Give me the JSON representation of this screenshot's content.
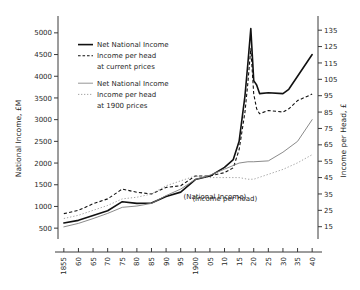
{
  "chart_data": {
    "type": "line",
    "title": "",
    "xlabel": "",
    "ylabel": "National Income, £M",
    "y2label": "Income per Head, £",
    "grid": false,
    "legend_position": "upper-left-inside",
    "x": [
      1855,
      1860,
      1865,
      1870,
      1875,
      1880,
      1885,
      1890,
      1895,
      1900,
      1905,
      1910,
      1915,
      1920,
      1925,
      1930,
      1935,
      1940
    ],
    "xlim": [
      1853,
      1942
    ],
    "xtick_labels": [
      "1855",
      "60",
      "65",
      "70",
      "75",
      "80",
      "85",
      "90",
      "95",
      "1900",
      "05",
      "10",
      "15",
      "20",
      "25",
      "30",
      "35",
      "40"
    ],
    "ylim": [
      250,
      5250
    ],
    "ytick_labels": [
      "500",
      "1000",
      "1500",
      "2000",
      "2500",
      "3000",
      "3500",
      "4000",
      "4500",
      "5000"
    ],
    "yticks": [
      500,
      1000,
      1500,
      2000,
      2500,
      3000,
      3500,
      4000,
      4500,
      5000
    ],
    "y2lim": [
      7.5,
      140
    ],
    "y2tick_labels": [
      "15",
      "25",
      "35",
      "45",
      "55",
      "65",
      "75",
      "85",
      "95",
      "105",
      "115",
      "125",
      "135"
    ],
    "y2ticks": [
      15,
      25,
      35,
      45,
      55,
      65,
      75,
      85,
      95,
      105,
      115,
      125,
      135
    ],
    "annotations": [
      {
        "text": "(National Income)",
        "x": 1896,
        "y_axis": "left",
        "y": 1180
      },
      {
        "text": "(Income per head)",
        "x": 1899,
        "y_axis": "right",
        "y": 31
      }
    ],
    "series": [
      {
        "name": "Net National Income at current prices",
        "axis": "left",
        "style": "solid-bold",
        "color": "#111111",
        "x": [
          1855,
          1860,
          1865,
          1870,
          1875,
          1880,
          1885,
          1890,
          1895,
          1900,
          1905,
          1910,
          1913,
          1915,
          1917,
          1918,
          1919,
          1920,
          1921,
          1922,
          1925,
          1930,
          1932,
          1935,
          1940
        ],
        "values": [
          620,
          680,
          790,
          900,
          1110,
          1070,
          1080,
          1230,
          1330,
          1620,
          1700,
          1900,
          2080,
          2500,
          3550,
          4300,
          5100,
          3900,
          3800,
          3600,
          3620,
          3600,
          3700,
          4000,
          4500
        ]
      },
      {
        "name": "Income per head at current prices",
        "axis": "right",
        "style": "dash-bold",
        "color": "#111111",
        "x": [
          1855,
          1860,
          1865,
          1870,
          1875,
          1880,
          1885,
          1890,
          1895,
          1900,
          1905,
          1910,
          1913,
          1915,
          1917,
          1918,
          1919,
          1920,
          1921,
          1922,
          1925,
          1930,
          1932,
          1935,
          1940
        ],
        "values": [
          23,
          25,
          29,
          32,
          38,
          36,
          35,
          39,
          40,
          46,
          46,
          48,
          51,
          62,
          85,
          103,
          124,
          96,
          87,
          84,
          86,
          85,
          87,
          92,
          96
        ]
      },
      {
        "name": "Net National Income at 1900 prices",
        "axis": "left",
        "style": "solid-thin",
        "color": "#7d7d7d",
        "x": [
          1855,
          1860,
          1865,
          1870,
          1875,
          1880,
          1885,
          1890,
          1895,
          1900,
          1905,
          1910,
          1915,
          1918,
          1920,
          1925,
          1930,
          1935,
          1940
        ],
        "values": [
          530,
          610,
          720,
          840,
          980,
          1010,
          1070,
          1250,
          1400,
          1620,
          1720,
          1860,
          2000,
          2030,
          2030,
          2050,
          2250,
          2500,
          3000
        ]
      },
      {
        "name": "Income per head at 1900 prices",
        "axis": "right",
        "style": "dash-thin",
        "color": "#9a9a9a",
        "x": [
          1855,
          1860,
          1865,
          1870,
          1875,
          1880,
          1885,
          1890,
          1895,
          1900,
          1905,
          1910,
          1915,
          1918,
          1920,
          1925,
          1930,
          1935,
          1940
        ],
        "values": [
          20,
          22,
          25,
          28,
          32,
          33,
          35,
          40,
          43,
          46,
          45,
          45,
          45,
          44,
          44,
          47,
          50,
          54,
          59
        ]
      }
    ]
  },
  "legend": {
    "entries": [
      {
        "label": "Net National Income",
        "style": "solid-bold"
      },
      {
        "label": "Income per head",
        "style": "dash-bold"
      },
      {
        "label": "at current prices",
        "style": "none"
      },
      {
        "label": "Net National Income",
        "style": "solid-thin"
      },
      {
        "label": "Income per head",
        "style": "dash-thin"
      },
      {
        "label": "at 1900 prices",
        "style": "none"
      }
    ]
  }
}
